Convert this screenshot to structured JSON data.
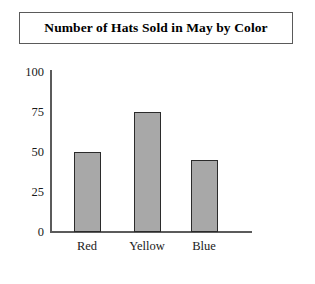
{
  "chart_data": {
    "type": "bar",
    "title": "Number of Hats Sold in May by Color",
    "xlabel": "",
    "ylabel": "",
    "categories": [
      "Red",
      "Yellow",
      "Blue"
    ],
    "values": [
      50,
      75,
      45
    ],
    "ylim": [
      0,
      100
    ],
    "yticks": [
      "0",
      "25",
      "50",
      "75",
      "100"
    ],
    "ytick_values": [
      0,
      25,
      50,
      75,
      100
    ],
    "grid": false,
    "legend": false,
    "legend_position": "none",
    "bar_fill_color": "#a8a8a8",
    "bar_border_color": "#2b2b2b",
    "axis_color": "#5b5b5b",
    "background_color": "#ffffff",
    "title_border_color": "#5a5a5a"
  }
}
